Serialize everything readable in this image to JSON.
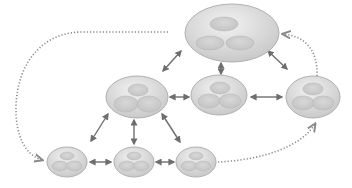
{
  "diagram": {
    "type": "network",
    "colors": {
      "node_fill_light": "#eeeeee",
      "node_fill_dark": "#c4c4c4",
      "node_stroke": "#b0b0b0",
      "arrow": "#6e6e6e",
      "dotted": "#8a8a8a"
    },
    "nodes": [
      {
        "id": "top",
        "cx": 232,
        "cy": 33,
        "rx": 47,
        "ry": 29
      },
      {
        "id": "mid-left",
        "cx": 137,
        "cy": 97,
        "rx": 31,
        "ry": 21
      },
      {
        "id": "mid-center",
        "cx": 219,
        "cy": 95,
        "rx": 28,
        "ry": 20
      },
      {
        "id": "mid-right",
        "cx": 313,
        "cy": 97,
        "rx": 27,
        "ry": 21
      },
      {
        "id": "bottom-left",
        "cx": 67,
        "cy": 162,
        "rx": 20,
        "ry": 15
      },
      {
        "id": "bottom-center",
        "cx": 134,
        "cy": 162,
        "rx": 20,
        "ry": 15
      },
      {
        "id": "bottom-right",
        "cx": 196,
        "cy": 162,
        "rx": 20,
        "ry": 15
      }
    ],
    "edges": [
      {
        "from": "top",
        "to": "mid-left",
        "style": "double-arrow"
      },
      {
        "from": "top",
        "to": "mid-center",
        "style": "double-arrow"
      },
      {
        "from": "top",
        "to": "mid-right",
        "style": "double-arrow"
      },
      {
        "from": "mid-left",
        "to": "mid-center",
        "style": "double-arrow"
      },
      {
        "from": "mid-center",
        "to": "mid-right",
        "style": "double-arrow"
      },
      {
        "from": "mid-left",
        "to": "bottom-left",
        "style": "double-arrow"
      },
      {
        "from": "mid-left",
        "to": "bottom-center",
        "style": "double-arrow"
      },
      {
        "from": "mid-left",
        "to": "bottom-right",
        "style": "double-arrow"
      },
      {
        "from": "bottom-left",
        "to": "bottom-center",
        "style": "double-arrow"
      },
      {
        "from": "bottom-center",
        "to": "bottom-right",
        "style": "double-arrow"
      },
      {
        "from": "top",
        "to": "bottom-left",
        "style": "dotted-arrow"
      },
      {
        "from": "bottom-right",
        "to": "mid-right",
        "style": "dotted-arrow"
      },
      {
        "from": "mid-right",
        "to": "top",
        "style": "dotted-arrow"
      }
    ]
  }
}
